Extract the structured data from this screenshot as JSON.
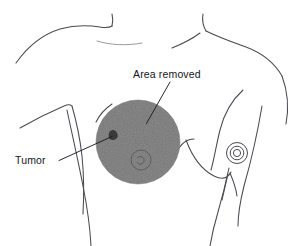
{
  "figure": {
    "background_color": "#ffffff",
    "line_color": "#4a4a52",
    "annotations": [
      {
        "id": "area-removed",
        "label": "Area removed",
        "text_x": 133,
        "text_y": 78,
        "leader": {
          "x1": 170,
          "y1": 82,
          "x2": 146.5,
          "y2": 123.5
        }
      },
      {
        "id": "tumor",
        "label": "Tumor",
        "text_x": 15,
        "text_y": 164,
        "leader": {
          "x1": 59,
          "y1": 160.5,
          "x2": 112,
          "y2": 136.5
        }
      }
    ],
    "removed_region": {
      "name": "Area removed",
      "shape": "circle",
      "center_x": 138,
      "center_y": 142,
      "radius": 42,
      "fill_color": "#8a8a8a",
      "texture": "stipple"
    },
    "tumor_marker": {
      "name": "Tumor",
      "shape": "blob",
      "center_x": 113,
      "center_y": 135,
      "radius": 4.5,
      "fill_color": "#3a3a3a"
    },
    "left_nipple": {
      "name": "Left nipple",
      "center_x": 141,
      "center_y": 160,
      "outer_radius": 10,
      "inner_radius": 4.5,
      "visible_through_shading": true
    },
    "right_nipple": {
      "name": "Right nipple",
      "center_x": 237,
      "center_y": 153,
      "outer_radius": 10.5,
      "middle_radius": 7,
      "inner_radius": 4
    }
  }
}
